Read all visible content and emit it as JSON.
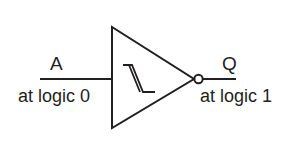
{
  "diagram": {
    "input": {
      "name": "A",
      "state": "at logic 0"
    },
    "output": {
      "name": "Q",
      "state": "at logic 1"
    },
    "gate_symbol": "schmitt-hysteresis-icon",
    "stroke_color": "#231f20"
  }
}
